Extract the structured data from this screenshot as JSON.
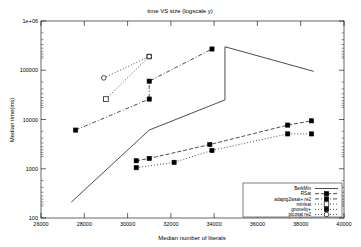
{
  "chart": {
    "title": "time VS size (logscale y)",
    "xlabel": "Median number of literals",
    "ylabel": "Median time(ms)"
  },
  "axes": {
    "x_ticks": [
      "26000",
      "28000",
      "30000",
      "32000",
      "34000",
      "36000",
      "38000",
      "40000"
    ],
    "y_ticks": [
      "100",
      "1000",
      "10000",
      "100000",
      "1e+06"
    ]
  },
  "legend": {
    "entries": [
      {
        "label": "BerkMin",
        "key": "berkmin"
      },
      {
        "label": "RSat",
        "key": "rsat"
      },
      {
        "label": "adaptg2wsat+ re2",
        "key": "adaptg2wsat"
      },
      {
        "label": "minisat",
        "key": "minisat"
      },
      {
        "label": "gnovelty+",
        "key": "gnovelty"
      },
      {
        "label": "picosat re2",
        "key": "picosat"
      }
    ]
  },
  "chart_data": {
    "type": "line",
    "title": "time VS size (logscale y)",
    "xlabel": "Median number of literals",
    "ylabel": "Median time(ms)",
    "xlim": [
      26000,
      40000
    ],
    "ylim": [
      100,
      1000000
    ],
    "yscale": "log",
    "grid": false,
    "legend_position": "bottom-right",
    "series": [
      {
        "name": "BerkMin",
        "marker": "none",
        "line": "solid",
        "x": [
          27400,
          31000,
          34500,
          34500,
          38600
        ],
        "y": [
          210,
          6100,
          25000,
          300000,
          95000
        ]
      },
      {
        "name": "RSat",
        "marker": "filled-square",
        "line": "dashed",
        "x": [
          30400,
          31000,
          33800,
          37400,
          38500
        ],
        "y": [
          1450,
          1620,
          3100,
          7700,
          9400
        ]
      },
      {
        "name": "adaptg2wsat+ re2",
        "marker": "filled-square",
        "line": "dash-dot",
        "x": [
          27600,
          31000,
          31000,
          33900
        ],
        "y": [
          6100,
          26000,
          60000,
          270000
        ]
      },
      {
        "name": "minisat",
        "marker": "open-square",
        "line": "dotted",
        "x": [
          29000,
          31000
        ],
        "y": [
          26000,
          190000
        ]
      },
      {
        "name": "gnovelty+",
        "marker": "filled-square",
        "line": "dotted",
        "x": [
          30400,
          32150,
          33900,
          37400,
          38500
        ],
        "y": [
          1050,
          1350,
          2350,
          5100,
          5100
        ]
      },
      {
        "name": "picosat re2",
        "marker": "open-circle",
        "line": "dotted",
        "x": [
          28900,
          31000
        ],
        "y": [
          70000,
          190000
        ]
      }
    ]
  }
}
